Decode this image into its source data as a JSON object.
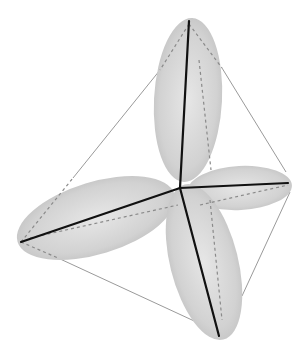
{
  "diagram": {
    "type": "tetrahedral-orbitals",
    "center": [
      180,
      188
    ],
    "vertices": {
      "top": [
        189,
        21
      ],
      "right": [
        288,
        183
      ],
      "left": [
        21,
        242
      ],
      "bottom": [
        219,
        336
      ]
    },
    "lobe_count": 4,
    "colors": {
      "background": "#ffffff",
      "lobe_fill": "#d9d9d9",
      "lobe_fill_dark": "#bdbdbd",
      "axis": "#111111",
      "edge": "#9a9a9a",
      "dash": "#8a8a8a"
    }
  }
}
